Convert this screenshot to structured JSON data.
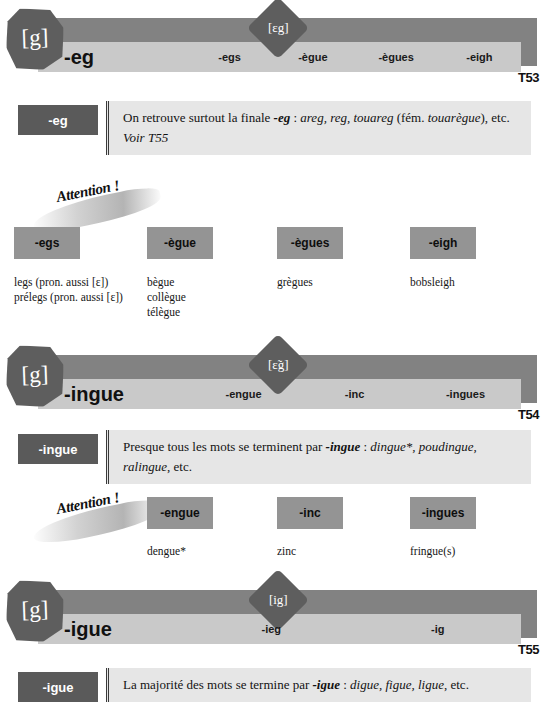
{
  "sections": [
    {
      "id": "T53",
      "sound": "[g]",
      "phoneme_badge": "[ɛg]",
      "headword": "-eg",
      "variants": [
        "-egs",
        "-ègue",
        "-ègues",
        "-eigh"
      ],
      "number": "T53",
      "explain": {
        "tag": "-eg",
        "lines": [
          {
            "parts": [
              {
                "text": "On retrouve surtout la finale ",
                "style": "plain"
              },
              {
                "text": "-eg",
                "style": "bolditalic"
              },
              {
                "text": " : ",
                "style": "plain"
              },
              {
                "text": "areg, reg, touareg",
                "style": "italic"
              },
              {
                "text": " (fém. ",
                "style": "plain"
              },
              {
                "text": "touarègue",
                "style": "italic"
              },
              {
                "text": "), etc.",
                "style": "plain"
              }
            ]
          },
          {
            "parts": [
              {
                "text": "Voir T55",
                "style": "italic"
              }
            ]
          }
        ]
      },
      "attention": {
        "label": "Attention !",
        "columns": [
          {
            "chip": "-egs",
            "words": [
              "legs (pron. aussi [ɛ])",
              "prélegs (pron. aussi [ɛ])"
            ]
          },
          {
            "chip": "-ègue",
            "words": [
              "bègue",
              "collègue",
              "télègue"
            ]
          },
          {
            "chip": "-ègues",
            "words": [
              "grègues"
            ]
          },
          {
            "chip": "-eigh",
            "words": [
              "bobsleigh"
            ]
          }
        ]
      }
    },
    {
      "id": "T54",
      "sound": "[g]",
      "phoneme_badge": "[ɛ̃g]",
      "headword": "-ingue",
      "variants": [
        "-engue",
        "-inc",
        "-ingues"
      ],
      "number": "T54",
      "explain": {
        "tag": "-ingue",
        "lines": [
          {
            "parts": [
              {
                "text": "Presque tous les mots se terminent par ",
                "style": "plain"
              },
              {
                "text": "-ingue",
                "style": "bolditalic"
              },
              {
                "text": " : ",
                "style": "plain"
              },
              {
                "text": "dingue*, poudingue, ralingue",
                "style": "italic"
              },
              {
                "text": ", etc.",
                "style": "plain"
              }
            ]
          }
        ]
      },
      "attention": {
        "label": "Attention !",
        "columns": [
          {
            "chip": "-engue",
            "words": [
              "dengue*"
            ]
          },
          {
            "chip": "-inc",
            "words": [
              "zinc"
            ]
          },
          {
            "chip": "-ingues",
            "words": [
              "fringue(s)"
            ]
          }
        ]
      }
    },
    {
      "id": "T55",
      "sound": "[g]",
      "phoneme_badge": "[ig]",
      "headword": "-igue",
      "variants": [
        "-ieg",
        "-ig"
      ],
      "number": "T55",
      "explain": {
        "tag": "-igue",
        "lines": [
          {
            "parts": [
              {
                "text": "La majorité des mots se termine par ",
                "style": "plain"
              },
              {
                "text": "-igue",
                "style": "bolditalic"
              },
              {
                "text": " : ",
                "style": "plain"
              },
              {
                "text": "digue, figue, ligue",
                "style": "italic"
              },
              {
                "text": ", etc.",
                "style": "plain"
              }
            ]
          }
        ]
      },
      "attention": null
    }
  ],
  "colors": {
    "bar_dark": "#828282",
    "bar_light": "#c9c9c9",
    "badge": "#5e5e5e",
    "tag": "#5a5a5a",
    "chip": "#949494",
    "explain_bg": "#e6e6e6"
  }
}
